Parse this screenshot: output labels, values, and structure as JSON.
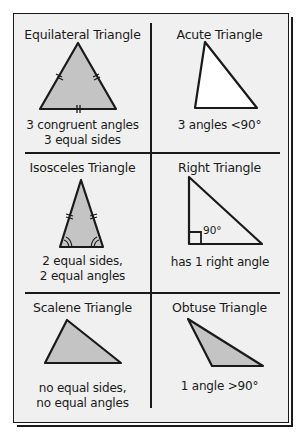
{
  "cells": [
    {
      "title": "Equilateral Triangle",
      "desc_line1": "3 congruent angles",
      "desc_line2": "3 equal sides"
    },
    {
      "title": "Acute Triangle",
      "desc_line1": "3 angles <90°",
      "desc_line2": ""
    },
    {
      "title": "Isosceles Triangle",
      "desc_line1": "2 equal sides,",
      "desc_line2": "2 equal angles"
    },
    {
      "title": "Right Triangle",
      "desc_line1": "has 1 right angle",
      "desc_line2": "",
      "angle_label": "90°"
    },
    {
      "title": "Scalene Triangle",
      "desc_line1": "no equal sides,",
      "desc_line2": "no equal angles"
    },
    {
      "title": "Obtuse Triangle",
      "desc_line1": "1 angle >90°",
      "desc_line2": ""
    }
  ],
  "colors": {
    "fill": "#c4c4c4",
    "stroke": "#1a1a1a",
    "card": "#f0f0f0",
    "white_fill": "#ffffff"
  }
}
